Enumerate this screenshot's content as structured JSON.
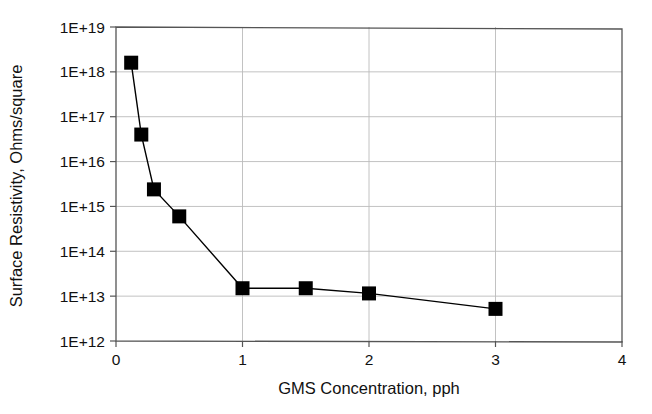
{
  "chart_data": {
    "type": "line",
    "title": "",
    "subtitle": "",
    "xlabel": "GMS Concentration, pph",
    "ylabel": "Surface Resistivity, Ohms/square",
    "xlim": [
      0,
      4
    ],
    "ylim": [
      1000000000000.0,
      1e+19
    ],
    "yscale": "log",
    "xscale": "linear",
    "grid": true,
    "legend": "none",
    "marker": "filled-square",
    "line_color": "#000000",
    "marker_color": "#000000",
    "xticks": [
      0,
      1,
      2,
      3,
      4
    ],
    "xtick_labels": [
      "0",
      "1",
      "2",
      "3",
      "4"
    ],
    "yticks": [
      1000000000000.0,
      10000000000000.0,
      100000000000000.0,
      1000000000000000.0,
      1e+16,
      1e+17,
      1e+18,
      1e+19
    ],
    "ytick_labels": [
      "1E+12",
      "1E+13",
      "1E+14",
      "1E+15",
      "1E+16",
      "1E+17",
      "1E+18",
      "1E+19"
    ],
    "series": [
      {
        "name": "Surface Resistivity",
        "x": [
          0.12,
          0.2,
          0.3,
          0.5,
          1.0,
          1.5,
          2.0,
          3.0
        ],
        "y": [
          1.6e+18,
          4e+16,
          2400000000000000.0,
          600000000000000.0,
          15000000000000.0,
          15000000000000.0,
          11500000000000.0,
          5200000000000.0
        ]
      }
    ],
    "points": [
      {
        "x": 0.12,
        "y": 1.6e+18
      },
      {
        "x": 0.2,
        "y": 4e+16
      },
      {
        "x": 0.3,
        "y": 2400000000000000.0
      },
      {
        "x": 0.5,
        "y": 600000000000000.0
      },
      {
        "x": 1.0,
        "y": 15000000000000.0
      },
      {
        "x": 1.5,
        "y": 15000000000000.0
      },
      {
        "x": 2.0,
        "y": 11500000000000.0
      },
      {
        "x": 3.0,
        "y": 5200000000000.0
      }
    ]
  },
  "axes": {
    "x_title": "GMS Concentration, pph",
    "y_title": "Surface Resistivity, Ohms/square"
  },
  "colors": {
    "frame": "#555555",
    "grid": "#bbbbbb",
    "data": "#000000",
    "background": "#ffffff"
  }
}
